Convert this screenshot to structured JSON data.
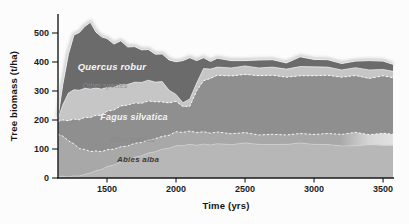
{
  "figure": {
    "background": "#fcfcfc"
  },
  "chart_data": {
    "type": "area",
    "stacked": true,
    "title": "",
    "xlabel": "Time (yrs)",
    "ylabel": "Tree biomass (t/ha)",
    "xlim": [
      1145,
      3572
    ],
    "ylim": [
      0,
      560
    ],
    "x_ticks": [
      1500,
      2000,
      2500,
      3000,
      3500
    ],
    "y_ticks": [
      0,
      100,
      200,
      300,
      400,
      500
    ],
    "grid": false,
    "legend": "labels-inside-areas",
    "series_order": "bottom-to-top",
    "x": [
      1145,
      1180,
      1220,
      1260,
      1300,
      1340,
      1380,
      1420,
      1460,
      1500,
      1550,
      1600,
      1650,
      1700,
      1750,
      1800,
      1850,
      1900,
      1950,
      2000,
      2050,
      2100,
      2150,
      2200,
      2250,
      2300,
      2400,
      2500,
      2600,
      2700,
      2800,
      2900,
      3000,
      3100,
      3200,
      3300,
      3400,
      3500,
      3572
    ],
    "series": [
      {
        "name": "Abies alba",
        "color": "#b7b7b7",
        "values": [
          5,
          5,
          5,
          6,
          8,
          12,
          18,
          24,
          30,
          38,
          46,
          54,
          62,
          70,
          78,
          85,
          92,
          98,
          104,
          110,
          113,
          115,
          114,
          116,
          115,
          117,
          116,
          120,
          117,
          114,
          117,
          120,
          117,
          114,
          112,
          110,
          116,
          112,
          113
        ],
        "label": {
          "text": "Abies alba",
          "t": 1725,
          "v": 66,
          "class": "species-dark",
          "size": 8
        }
      },
      {
        "name": "Other species (lower)",
        "color": "#a8a8a8",
        "gradient": {
          "to": "#e2e2e2",
          "hold": 0.84,
          "ramp": 0.93
        },
        "values": [
          145,
          138,
          125,
          110,
          95,
          85,
          75,
          68,
          62,
          58,
          55,
          52,
          50,
          48,
          46,
          45,
          45,
          44,
          45,
          48,
          46,
          45,
          44,
          42,
          41,
          40,
          38,
          35,
          33,
          35,
          33,
          32,
          35,
          38,
          40,
          46,
          35,
          41,
          38
        ],
        "label": {
          "text": "Other species",
          "t": 1681,
          "v": 131,
          "class": "other",
          "size": 6.8
        }
      },
      {
        "name": "Fagus silvatica",
        "color": "#8f8f8f",
        "values": [
          45,
          55,
          70,
          85,
          100,
          110,
          118,
          122,
          126,
          132,
          136,
          140,
          142,
          138,
          136,
          133,
          128,
          118,
          112,
          104,
          90,
          85,
          145,
          175,
          190,
          195,
          200,
          200,
          205,
          203,
          200,
          198,
          203,
          200,
          198,
          195,
          195,
          197,
          195
        ],
        "label": {
          "text": "Fagus silvatica",
          "t": 1696,
          "v": 210,
          "class": "species-light",
          "size": 9
        }
      },
      {
        "name": "Other species (upper)",
        "color": "#c6c6c6",
        "values": [
          10,
          52,
          95,
          101,
          102,
          100,
          98,
          94,
          91,
          82,
          78,
          74,
          71,
          72,
          72,
          72,
          68,
          70,
          44,
          24,
          13,
          25,
          27,
          42,
          32,
          28,
          28,
          29,
          27,
          28,
          28,
          32,
          31,
          28,
          25,
          27,
          29,
          22,
          22
        ],
        "label": {
          "text": "Other species",
          "t": 1486,
          "v": 317,
          "class": "other",
          "size": 6.8
        }
      },
      {
        "name": "Quercus robur",
        "color": "#6b6b6b",
        "values": [
          5,
          70,
          135,
          188,
          200,
          213,
          231,
          192,
          181,
          168,
          150,
          150,
          130,
          122,
          113,
          105,
          97,
          95,
          105,
          112,
          146,
          142,
          78,
          37,
          27,
          30,
          26,
          18,
          28,
          25,
          22,
          33,
          26,
          25,
          23,
          22,
          33,
          28,
          24
        ],
        "label": {
          "text": "Quercus robur",
          "t": 1536,
          "v": 383,
          "class": "species-light",
          "size": 9.5
        }
      }
    ],
    "colors": {
      "axis": "#1a1a1a",
      "tick_text": "#1c1c1c",
      "label_light": "#f5f5f5",
      "label_dark": "#3a3a3a",
      "label_other": "#8a8a8a",
      "boundary_dotted": "#ffffff",
      "top_halo": "#c2c2c2"
    }
  }
}
